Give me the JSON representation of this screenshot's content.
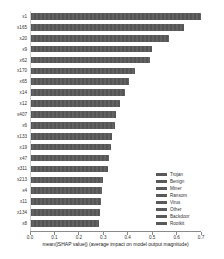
{
  "chart_data": {
    "type": "bar",
    "orientation": "horizontal",
    "categories": [
      "x1",
      "x165",
      "x20",
      "x9",
      "x62",
      "x170",
      "x65",
      "x14",
      "x12",
      "x407",
      "x6",
      "x133",
      "x19",
      "x47",
      "x311",
      "x213",
      "x4",
      "x11",
      "x134",
      "x8"
    ],
    "values": [
      0.7,
      0.63,
      0.57,
      0.5,
      0.49,
      0.43,
      0.405,
      0.39,
      0.37,
      0.352,
      0.348,
      0.335,
      0.33,
      0.325,
      0.32,
      0.3,
      0.296,
      0.29,
      0.286,
      0.283
    ],
    "title": "",
    "xlabel": "mean(|SHAP value|) (average impact on model output magnitude)",
    "ylabel": "",
    "xlim": [
      0,
      0.7
    ],
    "xticks": [
      "0.0",
      "0.1",
      "0.2",
      "0.3",
      "0.4",
      "0.5",
      "0.6",
      "0.7"
    ],
    "grid": false,
    "legend": {
      "position": "lower right",
      "entries": [
        "Trojan",
        "Benign",
        "Miner",
        "Ransom",
        "Virus",
        "Other",
        "Backdoor",
        "Rootkit"
      ]
    },
    "bar_color": "#595959",
    "legend_swatch_color": "#595959",
    "background_color": "#ffffff"
  }
}
